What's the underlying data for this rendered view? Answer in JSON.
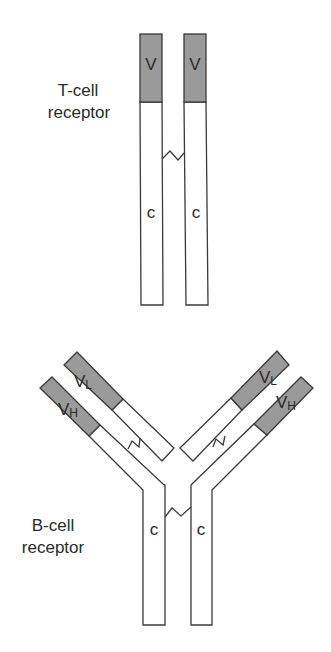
{
  "diagram": {
    "tcell": {
      "label_line1": "T-cell",
      "label_line2": "receptor",
      "chain_left": {
        "variable": "V",
        "constant": "c"
      },
      "chain_right": {
        "variable": "V",
        "constant": "c"
      }
    },
    "bcell": {
      "label_line1": "B-cell",
      "label_line2": "receptor",
      "left_light": {
        "variable": "V",
        "sub": "L"
      },
      "left_heavy": {
        "variable": "V",
        "sub": "H"
      },
      "right_light": {
        "variable": "V",
        "sub": "L"
      },
      "right_heavy": {
        "variable": "V",
        "sub": "H"
      },
      "constant_left": "c",
      "constant_right": "c"
    },
    "colors": {
      "variable_region": "#9a9a9a",
      "constant_region": "#ffffff",
      "outline": "#3a3a3a"
    }
  }
}
